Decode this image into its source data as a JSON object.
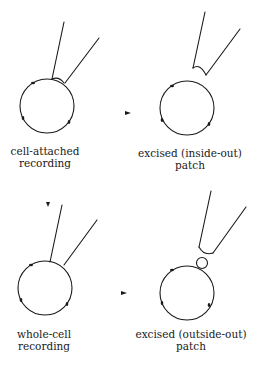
{
  "panels": [
    {
      "id": "cell-attached",
      "label_line1": "cell-attached",
      "label_line2": "recording"
    },
    {
      "id": "inside-out",
      "label_line1": "excised (inside-out)",
      "label_line2": "patch"
    },
    {
      "id": "whole-cell",
      "label_line1": "whole-cell",
      "label_line2": "recording"
    },
    {
      "id": "outside-out",
      "label_line1": "excised (outside-out)",
      "label_line2": "patch"
    }
  ],
  "colors": {
    "stroke": "#1a1a1a",
    "background": "#ffffff"
  }
}
